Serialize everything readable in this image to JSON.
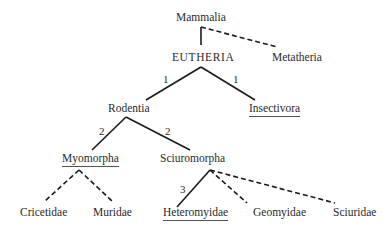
{
  "diagram": {
    "type": "taxonomic-tree",
    "nodes": {
      "mammalia": {
        "label": "Mammalia",
        "underlined": false
      },
      "eutheria": {
        "label": "EUTHERIA",
        "underlined": false
      },
      "metatheria": {
        "label": "Metatheria",
        "underlined": false
      },
      "rodentia": {
        "label": "Rodentia",
        "underlined": false
      },
      "insectivora": {
        "label": "Insectivora",
        "underlined": true
      },
      "myomorpha": {
        "label": "Myomorpha",
        "underlined": true
      },
      "sciuromorpha": {
        "label": "Sciuromorpha",
        "underlined": false
      },
      "cricetidae": {
        "label": "Cricetidae",
        "underlined": false
      },
      "muridae": {
        "label": "Muridae",
        "underlined": false
      },
      "heteromyidae": {
        "label": "Heteromyidae",
        "underlined": true
      },
      "geomyidae": {
        "label": "Geomyidae",
        "underlined": false
      },
      "sciuridae": {
        "label": "Sciuridae",
        "underlined": false
      }
    },
    "edges": [
      {
        "from": "Mammalia",
        "to": "EUTHERIA",
        "style": "solid",
        "label": ""
      },
      {
        "from": "Mammalia",
        "to": "Metatheria",
        "style": "dashed",
        "label": ""
      },
      {
        "from": "EUTHERIA",
        "to": "Rodentia",
        "style": "solid",
        "label": "1"
      },
      {
        "from": "EUTHERIA",
        "to": "Insectivora",
        "style": "solid",
        "label": "1"
      },
      {
        "from": "Rodentia",
        "to": "Myomorpha",
        "style": "solid",
        "label": "2"
      },
      {
        "from": "Rodentia",
        "to": "Sciuromorpha",
        "style": "solid",
        "label": "2"
      },
      {
        "from": "Myomorpha",
        "to": "Cricetidae",
        "style": "dashed",
        "label": ""
      },
      {
        "from": "Myomorpha",
        "to": "Muridae",
        "style": "dashed",
        "label": ""
      },
      {
        "from": "Sciuromorpha",
        "to": "Heteromyidae",
        "style": "solid",
        "label": "3"
      },
      {
        "from": "Sciuromorpha",
        "to": "Geomyidae",
        "style": "dashed",
        "label": ""
      },
      {
        "from": "Sciuromorpha",
        "to": "Sciuridae",
        "style": "dashed",
        "label": ""
      }
    ],
    "edge_labels": {
      "eutheria_rodentia": "1",
      "eutheria_insectivora": "1",
      "rodentia_myomorpha": "2",
      "rodentia_sciuromorpha": "2",
      "sciuromorpha_heteromyidae": "3"
    },
    "colors": {
      "line": "#1a1a1a",
      "text": "#2a2a2a",
      "background": "#ffffff"
    }
  }
}
